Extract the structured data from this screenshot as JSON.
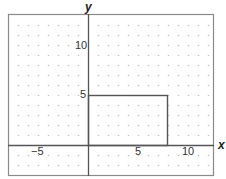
{
  "chart_data": {
    "type": "scatter",
    "title": "",
    "xlabel": "x",
    "ylabel": "y",
    "xlim": [
      -8,
      12.6
    ],
    "ylim": [
      -3.1,
      13.1
    ],
    "grid": "dot grid, 1 unit spacing",
    "x_ticks": [
      "-5",
      "5",
      "10"
    ],
    "y_ticks": [
      "5",
      "10"
    ],
    "shapes": [
      {
        "type": "rectangle",
        "vertices": [
          [
            0,
            0
          ],
          [
            8,
            0
          ],
          [
            8,
            5
          ],
          [
            0,
            5
          ]
        ],
        "description": "Rectangle with width 8 and height 5, lower-left corner at origin"
      }
    ]
  },
  "labels": {
    "x_axis": "x",
    "y_axis": "y",
    "x_tick_neg5": "−5",
    "x_tick_5": "5",
    "x_tick_10": "10",
    "y_tick_5": "5",
    "y_tick_10": "10"
  },
  "colors": {
    "frame": "#8a8a8a",
    "axis": "#555555",
    "rect": "#555555",
    "dots": "#c4c4c4"
  }
}
